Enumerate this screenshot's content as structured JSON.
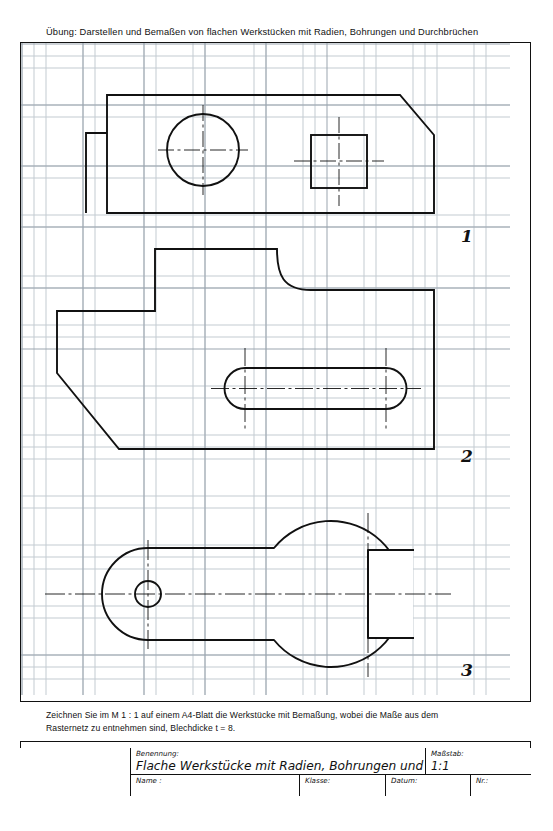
{
  "header": {
    "title": "Übung:  Darstellen und Bemaßen von flachen Werkstücken mit Radien, Bohrungen und Durchbrüchen"
  },
  "instruction": {
    "line1": "Zeichnen Sie im M 1 : 1 auf einem A4-Blatt die Werkstücke mit Bemaßung, wobei die Maße aus dem",
    "line2": "Rasternetz zu entnehmen sind, Blechdicke t = 8."
  },
  "title_block": {
    "benennung_label": "Benennung:",
    "benennung_value": "Flache Werkstücke mit Radien, Bohrungen und Durchbrüchen",
    "massstab_label": "Maßstab:",
    "massstab_value": "1:1",
    "name_label": "Name :",
    "name_value": "",
    "klasse_label": "Klasse:",
    "klasse_value": "",
    "datum_label": "Datum:",
    "datum_value": "",
    "nr_label": "Nr.:",
    "nr_value": ""
  },
  "parts": [
    {
      "number": "1",
      "name": "flat-plate-with-circular-and-square-hole"
    },
    {
      "number": "2",
      "name": "stepped-plate-with-elongated-slot"
    },
    {
      "number": "3",
      "name": "open-end-wrench-shape"
    }
  ],
  "colors": {
    "ink": "#111111",
    "grid_minor": "#c3cad1",
    "grid_major": "#9aa4ae",
    "paper": "#ffffff"
  }
}
